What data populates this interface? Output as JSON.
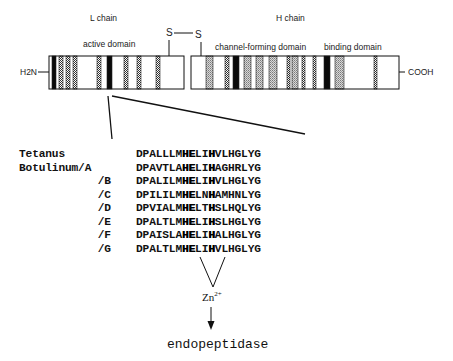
{
  "figure": {
    "labels": {
      "l_chain": "L chain",
      "h_chain": "H chain",
      "active_domain": "active domain",
      "channel_forming_domain": "channel-forming domain",
      "binding_domain": "binding domain",
      "n_terminus": "H2N",
      "c_terminus": "COOH",
      "disulfide_left": "S",
      "disulfide_right": "S"
    },
    "l_chain_bar": {
      "x": 49,
      "width": 135,
      "stripes": [
        {
          "x": 52,
          "w": 4,
          "type": "black"
        },
        {
          "x": 59,
          "w": 4,
          "type": "dotted"
        },
        {
          "x": 66,
          "w": 4,
          "type": "dotted"
        },
        {
          "x": 73,
          "w": 4,
          "type": "dotted"
        },
        {
          "x": 97,
          "w": 4,
          "type": "dotted"
        },
        {
          "x": 107,
          "w": 5,
          "type": "black"
        },
        {
          "x": 124,
          "w": 4,
          "type": "dotted"
        },
        {
          "x": 137,
          "w": 4,
          "type": "dotted"
        },
        {
          "x": 156,
          "w": 4,
          "type": "dotted"
        }
      ]
    },
    "h_chain_bar": {
      "x": 191,
      "width": 208,
      "stripes": [
        {
          "x": 206,
          "w": 7,
          "type": "grey"
        },
        {
          "x": 225,
          "w": 4,
          "type": "dotted"
        },
        {
          "x": 233,
          "w": 6,
          "type": "black"
        },
        {
          "x": 244,
          "w": 7,
          "type": "grey"
        },
        {
          "x": 256,
          "w": 7,
          "type": "grey"
        },
        {
          "x": 269,
          "w": 8,
          "type": "grey"
        },
        {
          "x": 287,
          "w": 3,
          "type": "dotted"
        },
        {
          "x": 292,
          "w": 6,
          "type": "grey"
        },
        {
          "x": 302,
          "w": 3,
          "type": "dotted"
        },
        {
          "x": 313,
          "w": 3,
          "type": "dotted"
        },
        {
          "x": 324,
          "w": 6,
          "type": "black"
        },
        {
          "x": 335,
          "w": 9,
          "type": "grey"
        },
        {
          "x": 374,
          "w": 3,
          "type": "dotted"
        }
      ]
    },
    "sequences": [
      {
        "name": "Tetanus",
        "pre": "DPALLLM",
        "h1": "HE",
        "mid": "LI",
        "h2": "H",
        "post": "VLHGLYG"
      },
      {
        "name": "Botulinum/A",
        "pre": "DPAVTLA",
        "h1": "HE",
        "mid": "LI",
        "h2": "H",
        "post": "AGHRLYG"
      },
      {
        "name": "/B",
        "pre": "DPALILM",
        "h1": "HE",
        "mid": "LI",
        "h2": "H",
        "post": "VLHGLYG"
      },
      {
        "name": "/C",
        "pre": "DPILILM",
        "h1": "HE",
        "mid": "LN",
        "h2": "H",
        "post": "AMHNLYG"
      },
      {
        "name": "/D",
        "pre": "DPVIALM",
        "h1": "HE",
        "mid": "LT",
        "h2": "H",
        "post": "SLHQLYG"
      },
      {
        "name": "/E",
        "pre": "DPALTLM",
        "h1": "HE",
        "mid": "LI",
        "h2": "H",
        "post": "SLHGLYG"
      },
      {
        "name": "/F",
        "pre": "DPAISLA",
        "h1": "HE",
        "mid": "LI",
        "h2": "H",
        "post": "ALHGLYG"
      },
      {
        "name": "/G",
        "pre": "DPALTLM",
        "h1": "HE",
        "mid": "LI",
        "h2": "H",
        "post": "VLHGLYG"
      }
    ],
    "zinc": {
      "symbol": "Zn",
      "charge": "2+"
    },
    "result": "endopeptidase"
  }
}
